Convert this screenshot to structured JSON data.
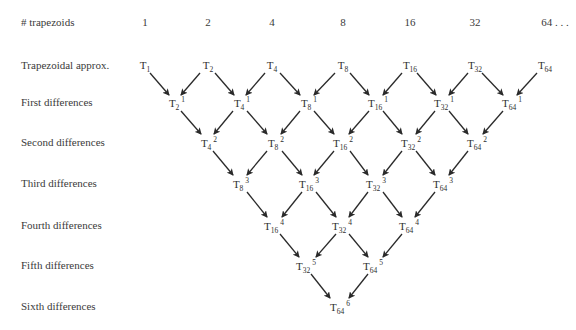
{
  "header": {
    "label": "# trapezoids",
    "counts": [
      "1",
      "2",
      "4",
      "8",
      "16",
      "32",
      "64 . . ."
    ]
  },
  "rows": [
    {
      "label": "Trapezoidal approx."
    },
    {
      "label": "First differences"
    },
    {
      "label": "Second differences"
    },
    {
      "label": "Third differences"
    },
    {
      "label": "Fourth differences"
    },
    {
      "label": "Fifth differences"
    },
    {
      "label": "Sixth differences"
    }
  ],
  "nodes": {
    "row0": [
      {
        "base": "T",
        "sub": "1",
        "sup": ""
      },
      {
        "base": "T",
        "sub": "2",
        "sup": ""
      },
      {
        "base": "T",
        "sub": "4",
        "sup": ""
      },
      {
        "base": "T",
        "sub": "8",
        "sup": ""
      },
      {
        "base": "T",
        "sub": "16",
        "sup": ""
      },
      {
        "base": "T",
        "sub": "32",
        "sup": ""
      },
      {
        "base": "T",
        "sub": "64",
        "sup": ""
      }
    ],
    "row1": [
      {
        "base": "T",
        "sub": "2",
        "sup": "1"
      },
      {
        "base": "T",
        "sub": "4",
        "sup": "1"
      },
      {
        "base": "T",
        "sub": "8",
        "sup": "1"
      },
      {
        "base": "T",
        "sub": "16",
        "sup": "1"
      },
      {
        "base": "T",
        "sub": "32",
        "sup": "1"
      },
      {
        "base": "T",
        "sub": "64",
        "sup": "1"
      }
    ],
    "row2": [
      {
        "base": "T",
        "sub": "4",
        "sup": "2"
      },
      {
        "base": "T",
        "sub": "8",
        "sup": "2"
      },
      {
        "base": "T",
        "sub": "16",
        "sup": "2"
      },
      {
        "base": "T",
        "sub": "32",
        "sup": "2"
      },
      {
        "base": "T",
        "sub": "64",
        "sup": "2"
      }
    ],
    "row3": [
      {
        "base": "T",
        "sub": "8",
        "sup": "3"
      },
      {
        "base": "T",
        "sub": "16",
        "sup": "3"
      },
      {
        "base": "T",
        "sub": "32",
        "sup": "3"
      },
      {
        "base": "T",
        "sub": "64",
        "sup": "3"
      }
    ],
    "row4": [
      {
        "base": "T",
        "sub": "16",
        "sup": "4"
      },
      {
        "base": "T",
        "sub": "32",
        "sup": "4"
      },
      {
        "base": "T",
        "sub": "64",
        "sup": "4"
      }
    ],
    "row5": [
      {
        "base": "T",
        "sub": "32",
        "sup": "5"
      },
      {
        "base": "T",
        "sub": "64",
        "sup": "5"
      }
    ],
    "row6": [
      {
        "base": "T",
        "sub": "64",
        "sup": "6"
      }
    ]
  },
  "colors": {
    "text": "#333333",
    "arrow": "#2a2a2a",
    "background": "#ffffff"
  }
}
